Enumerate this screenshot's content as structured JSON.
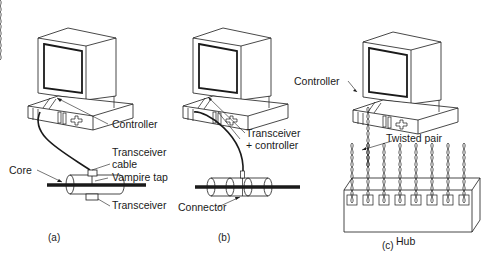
{
  "panels": [
    {
      "id": "a",
      "caption": "(a)",
      "labels": {
        "controller": "Controller",
        "transceiver_cable_1": "Transceiver",
        "transceiver_cable_2": "cable",
        "vampire_tap": "Vampire tap",
        "core": "Core",
        "transceiver": "Transceiver"
      }
    },
    {
      "id": "b",
      "caption": "(b)",
      "labels": {
        "transceiver_controller_1": "Transceiver",
        "transceiver_controller_2": "+ controller",
        "connector": "Connector"
      }
    },
    {
      "id": "c",
      "caption": "(c)",
      "labels": {
        "controller": "Controller",
        "twisted_pair": "Twisted pair",
        "hub": "Hub"
      },
      "hub_ports": 8
    }
  ],
  "colors": {
    "line": "#1a1a1a",
    "background": "#ffffff"
  }
}
